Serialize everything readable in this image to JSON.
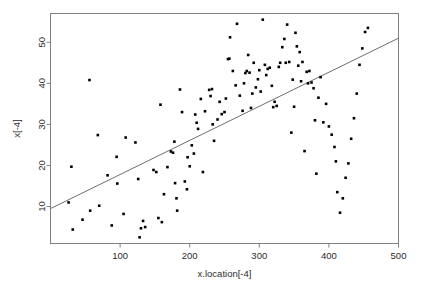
{
  "chart_data": {
    "type": "scatter",
    "title": "",
    "xlabel": "x.location[-4]",
    "ylabel": "x[-4]",
    "xlim": [
      0,
      500
    ],
    "ylim": [
      1,
      57
    ],
    "grid": false,
    "legend": null,
    "xticks": [
      100,
      200,
      300,
      400,
      500
    ],
    "yticks": [
      10,
      20,
      30,
      40,
      50
    ],
    "point_color": "#000000",
    "line_color": "#6e6e6e",
    "frame_color": "#808080",
    "fit_line": {
      "type": "linear",
      "slope": 0.083,
      "intercept": 9.5,
      "x_start": 0,
      "y_start": 9.5,
      "x_end": 500,
      "y_end": 51.0
    },
    "x": [
      26,
      30,
      32,
      46,
      56,
      57,
      68,
      70,
      82,
      88,
      95,
      96,
      105,
      108,
      122,
      126,
      128,
      130,
      133,
      136,
      148,
      152,
      155,
      158,
      160,
      163,
      168,
      173,
      176,
      178,
      179,
      181,
      182,
      186,
      189,
      193,
      196,
      197,
      200,
      203,
      206,
      208,
      210,
      212,
      216,
      219,
      222,
      228,
      230,
      232,
      233,
      235,
      240,
      243,
      246,
      250,
      252,
      255,
      257,
      258,
      262,
      266,
      268,
      272,
      276,
      278,
      280,
      282,
      284,
      286,
      288,
      290,
      292,
      295,
      298,
      300,
      302,
      305,
      308,
      310,
      312,
      315,
      318,
      320,
      322,
      325,
      328,
      330,
      333,
      336,
      338,
      340,
      343,
      346,
      348,
      350,
      352,
      354,
      356,
      358,
      360,
      362,
      365,
      368,
      370,
      372,
      375,
      378,
      380,
      382,
      385,
      388,
      392,
      396,
      400,
      404,
      408,
      410,
      412,
      416,
      420,
      424,
      428,
      432,
      436,
      440,
      444,
      448,
      452,
      456,
      460,
      482
    ],
    "y": [
      11.0,
      19.7,
      4.4,
      6.8,
      40.8,
      9.0,
      27.4,
      10.2,
      17.6,
      5.4,
      22.1,
      15.6,
      8.2,
      26.8,
      25.6,
      16.7,
      2.5,
      4.7,
      6.5,
      5.0,
      18.9,
      18.4,
      7.2,
      34.8,
      6.2,
      13.0,
      19.6,
      23.4,
      23.1,
      25.8,
      15.7,
      12.0,
      9.0,
      38.5,
      33.0,
      16.1,
      14.2,
      22.0,
      19.8,
      24.9,
      22.9,
      32.4,
      30.4,
      28.9,
      36.2,
      18.4,
      33.2,
      38.4,
      36.9,
      38.6,
      30.0,
      26.0,
      31.2,
      35.5,
      32.5,
      33.0,
      36.3,
      45.9,
      46.0,
      51.2,
      43.0,
      39.5,
      54.5,
      37.0,
      33.3,
      40.0,
      42.5,
      43.0,
      46.9,
      42.6,
      34.0,
      37.5,
      45.0,
      39.0,
      41.0,
      43.2,
      38.0,
      55.5,
      44.5,
      42.0,
      43.5,
      43.8,
      39.4,
      34.2,
      35.5,
      34.5,
      44.0,
      45.0,
      48.8,
      50.8,
      45.0,
      54.3,
      45.2,
      28.0,
      40.9,
      34.3,
      52.3,
      49.0,
      44.3,
      47.6,
      40.5,
      45.2,
      23.5,
      42.8,
      40.0,
      43.0,
      40.2,
      38.8,
      31.0,
      18.0,
      36.5,
      41.5,
      30.5,
      35.0,
      29.5,
      27.5,
      24.5,
      21.0,
      13.5,
      8.5,
      12.0,
      17.0,
      20.5,
      26.5,
      31.5,
      37.5,
      44.5,
      48.5,
      52.5,
      53.5
    ]
  }
}
